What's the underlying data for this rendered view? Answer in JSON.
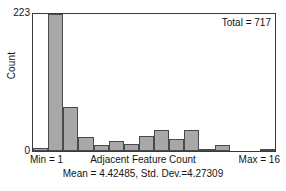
{
  "chart_data": {
    "type": "bar",
    "title": "",
    "subtitle": "",
    "xlabel": "Adjacent Feature Count",
    "ylabel": "Count",
    "categories": [
      1,
      2,
      3,
      4,
      5,
      6,
      7,
      8,
      9,
      10,
      11,
      12,
      13,
      14,
      15,
      16
    ],
    "values": [
      5,
      223,
      72,
      22,
      10,
      16,
      11,
      25,
      35,
      20,
      35,
      4,
      10,
      0,
      0,
      2
    ],
    "xlim": [
      1,
      16
    ],
    "ylim": [
      0,
      223
    ],
    "grid": false,
    "legend": null,
    "bar_fill_color": "#a8a8a8",
    "bar_edge_color": "#4a4a4a",
    "annotations": [
      "Total = 717",
      "Min = 1",
      "Max = 16",
      "Mean = 4.42485, Std. Dev.=4.27309"
    ]
  },
  "axes": {
    "y": {
      "label": "Count",
      "tick_top": "223",
      "tick_bottom": "0"
    },
    "x": {
      "label": "Adjacent Feature Count",
      "min_label": "Min = 1",
      "max_label": "Max = 16"
    }
  },
  "annotations": {
    "total": "Total = 717",
    "stats": "Mean = 4.42485, Std. Dev.=4.27309"
  }
}
